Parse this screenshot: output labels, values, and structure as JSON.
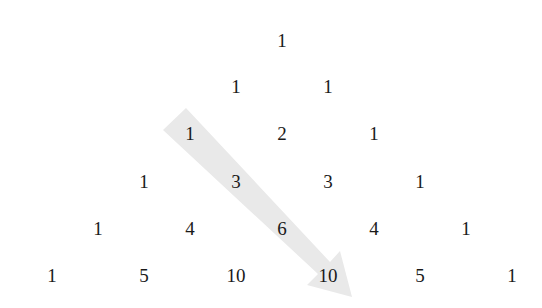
{
  "diagram": {
    "title": "",
    "type": "pascals-triangle",
    "rows": [
      [
        "1"
      ],
      [
        "1",
        "1"
      ],
      [
        "1",
        "2",
        "1"
      ],
      [
        "1",
        "3",
        "3",
        "1"
      ],
      [
        "1",
        "4",
        "6",
        "4",
        "1"
      ],
      [
        "1",
        "5",
        "10",
        "10",
        "5",
        "1"
      ]
    ],
    "highlight": {
      "shape": "arrow",
      "color": "#e8e8e8",
      "path_values": [
        "1",
        "3",
        "6",
        "10"
      ],
      "description": "diagonal arrow from row 3 left '1' down to row 6 second '10'"
    }
  }
}
